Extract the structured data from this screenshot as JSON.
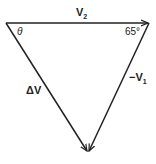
{
  "diagram": {
    "type": "vector-triangle",
    "vectors": [
      {
        "name": "V2",
        "label": "V",
        "subscript": "2",
        "from": "top-left",
        "to": "top-right"
      },
      {
        "name": "-V1",
        "label": "−V",
        "subscript": "1",
        "from": "top-right",
        "to": "bottom"
      },
      {
        "name": "dV",
        "label": "ΔV",
        "from": "top-left",
        "to": "bottom"
      }
    ],
    "angles": {
      "theta": "θ",
      "right_angle": "65°"
    },
    "colors": {
      "stroke": "#222222"
    }
  }
}
